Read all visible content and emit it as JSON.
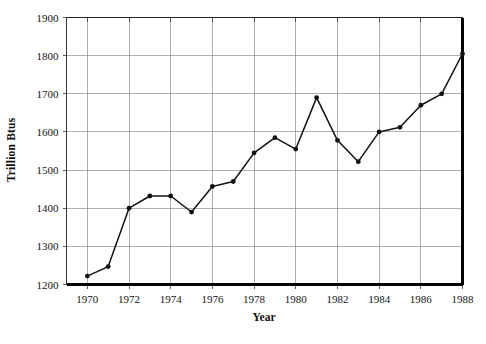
{
  "chart_data": {
    "type": "line",
    "title": "",
    "xlabel": "Year",
    "ylabel": "Trillion Btus",
    "xlim": [
      1969,
      1988
    ],
    "ylim": [
      1200,
      1900
    ],
    "grid": true,
    "legend": "none",
    "x": [
      1970,
      1971,
      1972,
      1973,
      1974,
      1975,
      1976,
      1977,
      1978,
      1979,
      1980,
      1981,
      1982,
      1983,
      1984,
      1985,
      1986,
      1987,
      1988
    ],
    "values": [
      1222,
      1247,
      1400,
      1432,
      1432,
      1390,
      1457,
      1470,
      1545,
      1585,
      1555,
      1690,
      1578,
      1522,
      1600,
      1612,
      1670,
      1700,
      1805
    ],
    "xticks": [
      1970,
      1972,
      1974,
      1976,
      1978,
      1980,
      1982,
      1984,
      1986,
      1988
    ],
    "xtick_labels": [
      "1970",
      "1972",
      "1974",
      "1976",
      "1978",
      "1980",
      "1982",
      "1984",
      "1986",
      "1988"
    ],
    "yticks": [
      1200,
      1300,
      1400,
      1500,
      1600,
      1700,
      1800,
      1900
    ],
    "ytick_labels": [
      "1200",
      "1300",
      "1400",
      "1500",
      "1600",
      "1700",
      "1800",
      "1900"
    ],
    "series": [
      {
        "name": "Energy consumption",
        "values": [
          1222,
          1247,
          1400,
          1432,
          1432,
          1390,
          1457,
          1470,
          1545,
          1585,
          1555,
          1690,
          1578,
          1522,
          1600,
          1612,
          1670,
          1700,
          1805
        ],
        "color": "#111111",
        "marker": "filled-circle"
      }
    ],
    "colors": {
      "line": "#111111",
      "grid": "#8d8d8d",
      "axis": "#000000",
      "text": "#141414",
      "background": "#ffffff"
    }
  }
}
